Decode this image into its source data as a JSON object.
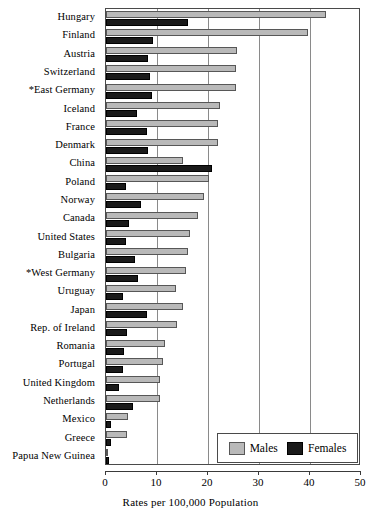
{
  "chart_data": {
    "type": "bar",
    "orientation": "horizontal",
    "title": "",
    "xlabel": "Rates per 100,000 Population",
    "ylabel": "",
    "xlim": [
      0,
      50
    ],
    "xticks": [
      0,
      10,
      20,
      30,
      40,
      50
    ],
    "xtick_labels": [
      "0",
      "10",
      "20",
      "30",
      "40",
      "50"
    ],
    "grid": true,
    "grid_axis": "x",
    "legend_position": "bottom-right",
    "categories": [
      "Hungary",
      "Finland",
      "Austria",
      "Switzerland",
      "*East Germany",
      "Iceland",
      "France",
      "Denmark",
      "China",
      "Poland",
      "Norway",
      "Canada",
      "United States",
      "Bulgaria",
      "*West Germany",
      "Uruguay",
      "Japan",
      "Rep. of Ireland",
      "Romania",
      "Portugal",
      "United Kingdom",
      "Netherlands",
      "Mexico",
      "Greece",
      "Papua New Guinea"
    ],
    "series": [
      {
        "name": "Males",
        "color": "#b9b9b9",
        "values": [
          43.2,
          39.6,
          25.7,
          25.5,
          25.5,
          22.3,
          21.9,
          21.9,
          15.0,
          20.1,
          19.2,
          18.0,
          16.4,
          16.0,
          15.6,
          13.8,
          15.0,
          14.0,
          11.5,
          11.1,
          10.5,
          10.5,
          4.4,
          4.2,
          0.4
        ]
      },
      {
        "name": "Females",
        "color": "#1a1a1a",
        "values": [
          16.0,
          9.3,
          8.3,
          8.7,
          9.1,
          6.0,
          8.1,
          8.3,
          20.7,
          4.0,
          6.8,
          4.6,
          4.0,
          5.6,
          6.2,
          3.4,
          8.1,
          4.2,
          3.6,
          3.4,
          2.6,
          5.2,
          0.9,
          0.9,
          0.5
        ]
      }
    ]
  },
  "legend": {
    "entries": [
      {
        "label": "Males"
      },
      {
        "label": "Females"
      }
    ]
  }
}
